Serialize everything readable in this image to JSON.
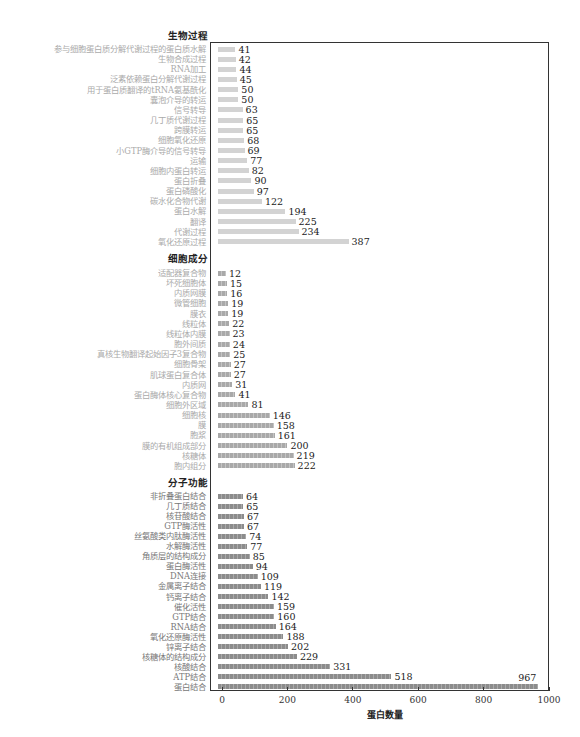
{
  "chart_data": {
    "type": "bar",
    "orientation": "horizontal",
    "title": "",
    "xlabel": "蛋白数量",
    "ylabel": "",
    "xlim": [
      0,
      1000
    ],
    "xticks": [
      0,
      200,
      400,
      600,
      800,
      1000
    ],
    "grid": false,
    "legend": null,
    "groups": [
      {
        "name": "生物过程",
        "key": "bp",
        "color": "#d3d3d3",
        "categories": [
          "参与细胞蛋白质分解代谢过程的蛋白质水解",
          "生物合成过程",
          "RNA加工",
          "泛素依赖蛋白分解代谢过程",
          "用于蛋白质翻译的tRNA氨基酰化",
          "囊泡介导的转运",
          "信号转导",
          "几丁质代谢过程",
          "跨膜转运",
          "细胞氧化还原",
          "小GTP酶介导的信号转导",
          "运输",
          "细胞内蛋白转运",
          "蛋白折叠",
          "蛋白磷酸化",
          "碳水化合物代谢",
          "蛋白水解",
          "翻译",
          "代谢过程",
          "氧化还原过程"
        ],
        "values": [
          41,
          42,
          44,
          45,
          50,
          50,
          63,
          65,
          65,
          68,
          69,
          77,
          82,
          90,
          97,
          122,
          194,
          225,
          234,
          387
        ]
      },
      {
        "name": "细胞成分",
        "key": "cc",
        "color": "#a9a9a9",
        "categories": [
          "适配器复合物",
          "坏死细胞体",
          "内质网膜",
          "微管细胞",
          "膜衣",
          "线粒体",
          "线粒体内膜",
          "胞外间质",
          "真核生物翻译起始因子3复合物",
          "细胞骨架",
          "肌球蛋白复合体",
          "内质网",
          "蛋白酶体核心复合物",
          "细胞外区域",
          "细胞核",
          "膜",
          "胞浆",
          "膜的有机组成部分",
          "核糖体",
          "胞内组分"
        ],
        "values": [
          12,
          15,
          16,
          19,
          19,
          22,
          23,
          24,
          25,
          27,
          27,
          31,
          41,
          81,
          146,
          158,
          161,
          200,
          219,
          222
        ]
      },
      {
        "name": "分子功能",
        "key": "mf",
        "color": "#8c8c8c",
        "categories": [
          "非折叠蛋白结合",
          "几丁质结合",
          "核苷酸结合",
          "GTP酶活性",
          "丝氨酸类内肽酶活性",
          "水解酶活性",
          "角质层的结构成分",
          "蛋白酶活性",
          "DNA连接",
          "金属离子结合",
          "钙离子结合",
          "催化活性",
          "GTP结合",
          "RNA结合",
          "氧化还原酶活性",
          "锌离子结合",
          "核糖体的结构成分",
          "核酸结合",
          "ATP结合",
          "蛋白结合"
        ],
        "values": [
          64,
          65,
          67,
          67,
          74,
          77,
          85,
          94,
          109,
          119,
          142,
          159,
          160,
          164,
          188,
          202,
          229,
          331,
          518,
          967
        ]
      }
    ]
  }
}
